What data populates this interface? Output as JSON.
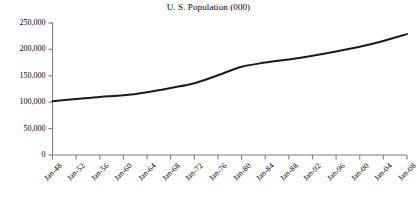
{
  "chart_data": {
    "type": "line",
    "title": "U. S. Population (000)",
    "xlabel": "",
    "ylabel": "",
    "grid": false,
    "legend": "none",
    "ylim": [
      0,
      250000
    ],
    "ytick_labels": [
      "250,000",
      "200,000",
      "150,000",
      "100,000",
      "50,000",
      "0"
    ],
    "ytick_values": [
      250000,
      200000,
      150000,
      100000,
      50000,
      0
    ],
    "categories": [
      "Jan-48",
      "Jan-52",
      "Jan-56",
      "Jan-60",
      "Jan-64",
      "Jan-68",
      "Jan-72",
      "Jan-76",
      "Jan-80",
      "Jan-84",
      "Jan-88",
      "Jan-92",
      "Jan-96",
      "Jan-00",
      "Jan-04",
      "Jan-08"
    ],
    "values": [
      102000,
      106000,
      110000,
      113000,
      119000,
      127000,
      136000,
      151000,
      167000,
      175000,
      181000,
      188000,
      196000,
      205000,
      216000,
      229000
    ],
    "series": [
      {
        "name": "U. S. Population (000)",
        "color": "#1a1a1a",
        "values": [
          102000,
          106000,
          110000,
          113000,
          119000,
          127000,
          136000,
          151000,
          167000,
          175000,
          181000,
          188000,
          196000,
          205000,
          216000,
          229000
        ]
      }
    ],
    "axis_color": "#808080",
    "line_color": "#1a1a1a",
    "background_color": "#ffffff"
  }
}
